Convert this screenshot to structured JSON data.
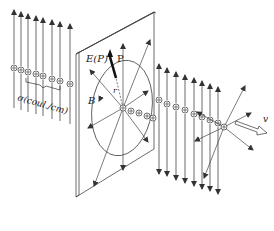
{
  "diagram": {
    "labels": {
      "electric_field": "E(P)",
      "point": "P",
      "radius": "r",
      "magnetic_field": "B",
      "charge_density": "σ(coul./cm)",
      "velocity": "v"
    },
    "colors": {
      "stroke": "#333333",
      "background": "#ffffff"
    },
    "left_field_lines": [
      {
        "x": 14,
        "top": 10,
        "charge_y": 68
      },
      {
        "x": 21,
        "top": 12,
        "charge_y": 70
      },
      {
        "x": 28,
        "top": 14,
        "charge_y": 72
      },
      {
        "x": 36,
        "top": 16,
        "charge_y": 74
      },
      {
        "x": 43,
        "top": 18,
        "charge_y": 76
      },
      {
        "x": 52,
        "top": 20,
        "charge_y": 79
      },
      {
        "x": 60,
        "top": 22,
        "charge_y": 81
      },
      {
        "x": 70,
        "top": 24,
        "charge_y": 84
      }
    ],
    "right_field_lines": [
      {
        "x": 159,
        "top": 64,
        "bottom": 174,
        "charge_y": 100
      },
      {
        "x": 167,
        "top": 68,
        "bottom": 176,
        "charge_y": 104
      },
      {
        "x": 176,
        "top": 72,
        "bottom": 180,
        "charge_y": 107
      },
      {
        "x": 185,
        "top": 75,
        "bottom": 183,
        "charge_y": 110
      },
      {
        "x": 194,
        "top": 78,
        "bottom": 186,
        "charge_y": 114
      },
      {
        "x": 202,
        "top": 81,
        "bottom": 189,
        "charge_y": 117
      },
      {
        "x": 210,
        "top": 84,
        "bottom": 191,
        "charge_y": 120
      },
      {
        "x": 218,
        "top": 87,
        "bottom": 194,
        "charge_y": 123
      }
    ]
  }
}
